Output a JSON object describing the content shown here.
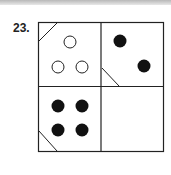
{
  "question": {
    "number_label": "23."
  },
  "puzzle": {
    "grid": "2x2",
    "line_color": "#222222",
    "cells": [
      {
        "position": "top-left",
        "dots": 3,
        "dot_style": "hollow",
        "corner_line": "top-left"
      },
      {
        "position": "top-right",
        "dots": 2,
        "dot_style": "filled",
        "corner_line": "bottom-left"
      },
      {
        "position": "bottom-left",
        "dots": 4,
        "dot_style": "filled",
        "corner_line": "bottom-left"
      },
      {
        "position": "bottom-right",
        "dots": 0,
        "dot_style": "none",
        "corner_line": "none",
        "state": "blank"
      }
    ]
  }
}
